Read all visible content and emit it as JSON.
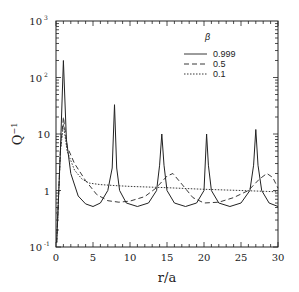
{
  "chart_data": {
    "type": "line",
    "title": "",
    "xlabel": "r/a",
    "ylabel": "Q^-1",
    "xlim": [
      0,
      30
    ],
    "ylim": [
      0.1,
      1000
    ],
    "yscale": "log",
    "grid": false,
    "x_ticks": [
      0,
      5,
      10,
      15,
      20,
      25,
      30
    ],
    "y_ticks": [
      {
        "value": 1000,
        "base": "10",
        "exp": "3"
      },
      {
        "value": 100,
        "base": "10",
        "exp": "2"
      },
      {
        "value": 10,
        "base": "10",
        "exp": ""
      },
      {
        "value": 1,
        "base": "1",
        "exp": ""
      },
      {
        "value": 0.1,
        "base": "10",
        "exp": "-1"
      }
    ],
    "legend": {
      "title": "β",
      "position": "upper right",
      "entries": [
        {
          "label": "0.999",
          "style": "solid"
        },
        {
          "label": "0.5",
          "style": "dashed"
        },
        {
          "label": "0.1",
          "style": "dotted"
        }
      ]
    },
    "series": [
      {
        "name": "β = 0.999",
        "style": "solid",
        "x": [
          0.1,
          0.6,
          1.0,
          1.4,
          2.0,
          3.0,
          4.0,
          5.0,
          6.0,
          7.0,
          7.6,
          7.9,
          8.2,
          8.6,
          9.5,
          11.0,
          12.5,
          13.6,
          14.0,
          14.3,
          14.6,
          15.0,
          16.0,
          17.5,
          19.0,
          20.0,
          20.35,
          20.6,
          21.0,
          22.0,
          23.5,
          25.0,
          26.2,
          26.7,
          27.0,
          27.3,
          27.8,
          28.8,
          30.0
        ],
        "y": [
          0.12,
          5,
          200,
          8,
          2.0,
          0.8,
          0.58,
          0.52,
          0.6,
          1.0,
          2.5,
          33,
          2.5,
          1.0,
          0.6,
          0.52,
          0.6,
          1.0,
          2.8,
          10,
          2.8,
          1.0,
          0.6,
          0.52,
          0.6,
          1.0,
          10,
          2.8,
          1.0,
          0.6,
          0.52,
          0.6,
          1.0,
          2.8,
          12,
          2.8,
          1.0,
          0.6,
          0.52
        ]
      },
      {
        "name": "β = 0.5",
        "style": "dashed",
        "x": [
          0.1,
          0.6,
          1.0,
          1.5,
          2.5,
          4.0,
          5.5,
          7.0,
          8.5,
          10.0,
          12.0,
          13.5,
          15.0,
          15.8,
          17.0,
          18.5,
          20.0,
          22.0,
          24.0,
          26.0,
          27.5,
          28.5,
          29.3,
          30.0
        ],
        "y": [
          0.12,
          5,
          20,
          6,
          3.0,
          1.5,
          0.85,
          0.66,
          0.62,
          0.65,
          0.78,
          1.1,
          1.8,
          2.0,
          1.3,
          0.75,
          0.6,
          0.62,
          0.75,
          1.0,
          1.6,
          2.0,
          1.7,
          1.1
        ]
      },
      {
        "name": "β = 0.1",
        "style": "dotted",
        "x": [
          0.1,
          0.6,
          1.0,
          1.5,
          2.5,
          3.5,
          4.5,
          6.0,
          8.0,
          10.0,
          15.0,
          20.0,
          25.0,
          30.0
        ],
        "y": [
          0.12,
          5,
          15,
          5,
          2.3,
          1.6,
          1.35,
          1.27,
          1.22,
          1.18,
          1.12,
          1.05,
          1.0,
          0.95
        ]
      }
    ]
  }
}
